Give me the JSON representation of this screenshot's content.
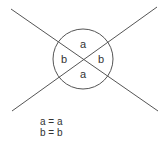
{
  "diagram": {
    "stroke_color": "#555555",
    "lines": [
      {
        "x1": 11,
        "y1": 9,
        "x2": 158,
        "y2": 111
      },
      {
        "x1": 12,
        "y1": 111,
        "x2": 157,
        "y2": 7
      }
    ],
    "circle": {
      "cx": 83,
      "cy": 59,
      "r": 30
    },
    "angle_labels": {
      "top": "a",
      "bottom": "a",
      "left": "b",
      "right": "b"
    },
    "equations": [
      "a = a",
      "b = b"
    ]
  }
}
